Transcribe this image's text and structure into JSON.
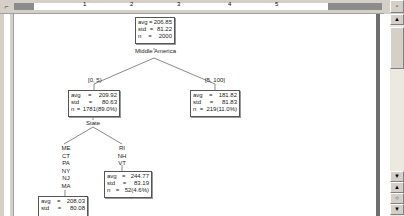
{
  "ruler": {
    "corner_icon": "tab-stop-icon",
    "numbers": [
      "1",
      "2",
      "3",
      "4",
      "5"
    ]
  },
  "tree": {
    "root": {
      "avg_label": "avg",
      "avg": "206.85",
      "std_label": "std",
      "std": "81.22",
      "n_label": "n",
      "n": "2000",
      "split": "Middle America"
    },
    "left_branch_label": "[0, 5)",
    "right_branch_label": "[5, 100]",
    "left": {
      "avg_label": "avg",
      "avg": "209.92",
      "std_label": "std",
      "std": "80.63",
      "n_label": "n",
      "n": "1781(89.0%)",
      "split": "State"
    },
    "right": {
      "avg_label": "avg",
      "avg": "181.82",
      "std_label": "std",
      "std": "81.83",
      "n_label": "n",
      "n": "219(11.0%)"
    },
    "left_left_states": [
      "ME",
      "CT",
      "PA",
      "NY",
      "NJ",
      "MA"
    ],
    "left_right_states": [
      "RI",
      "NH",
      "VT"
    ],
    "left_left": {
      "avg_label": "avg",
      "avg": "208.03",
      "std_label": "std",
      "std": "80.08"
    },
    "left_right": {
      "avg_label": "avg",
      "avg": "244.77",
      "std_label": "std",
      "std": "83.19",
      "n_label": "n",
      "n": "52(4.6%)"
    }
  },
  "scrollbar": {
    "up_icon": "▲",
    "down_icon": "▼",
    "prev_page_icon": "▲",
    "select_browse_icon": "○",
    "next_page_icon": "▼"
  }
}
